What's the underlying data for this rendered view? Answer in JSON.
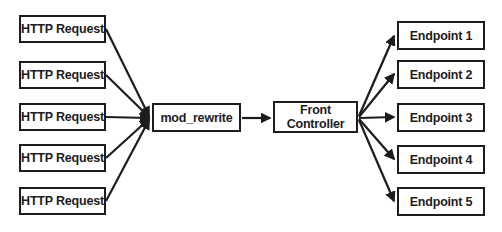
{
  "diagram": {
    "http_requests": [
      "HTTP Request",
      "HTTP Request",
      "HTTP Request",
      "HTTP Request",
      "HTTP Request"
    ],
    "mod_rewrite_label": "mod_rewrite",
    "front_controller_lines": [
      "Front",
      "Controller"
    ],
    "endpoints": [
      "Endpoint 1",
      "Endpoint 2",
      "Endpoint 3",
      "Endpoint 4",
      "Endpoint 5"
    ],
    "colors": {
      "background": "#ffffff",
      "box_fill": "#ffffff",
      "box_border": "#1d1d1d",
      "text": "#1d1d1d",
      "arrow": "#1d1d1d"
    }
  }
}
